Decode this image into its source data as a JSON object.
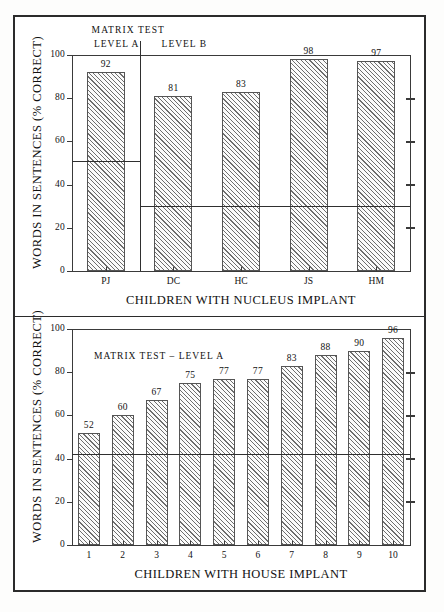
{
  "figure": {
    "background_color": "#ffffff",
    "frame_color": "#2b2b2b"
  },
  "chart_data": [
    {
      "type": "bar",
      "panel": "top",
      "title": "MATRIX TEST",
      "xlabel": "CHILDREN WITH NUCLEUS IMPLANT",
      "ylabel": "WORDS IN SENTENCES (% CORRECT)",
      "ylim": [
        0,
        100
      ],
      "yticks": [
        0,
        20,
        40,
        60,
        80,
        100
      ],
      "ytick_labels": [
        "0",
        "20",
        "40",
        "60",
        "80",
        "100"
      ],
      "grid": false,
      "legend": "none",
      "categories": [
        "PJ",
        "DC",
        "HC",
        "JS",
        "HM"
      ],
      "values": [
        92,
        81,
        83,
        98,
        97
      ],
      "value_labels": [
        "92",
        "81",
        "83",
        "98",
        "97"
      ],
      "groups": [
        {
          "label": "LEVEL A",
          "categories": [
            "PJ"
          ],
          "reference_line": 51
        },
        {
          "label": "LEVEL B",
          "categories": [
            "DC",
            "HC",
            "JS",
            "HM"
          ],
          "reference_line": 30
        }
      ],
      "group_divider_after": "PJ"
    },
    {
      "type": "bar",
      "panel": "bottom",
      "title": "MATRIX TEST – LEVEL A",
      "xlabel": "CHILDREN WITH HOUSE IMPLANT",
      "ylabel": "WORDS IN SENTENCES (% CORRECT)",
      "ylim": [
        0,
        100
      ],
      "yticks": [
        0,
        20,
        40,
        60,
        80,
        100
      ],
      "ytick_labels": [
        "0",
        "20",
        "40",
        "60",
        "80",
        "100"
      ],
      "grid": false,
      "legend": "none",
      "categories": [
        "1",
        "2",
        "3",
        "4",
        "5",
        "6",
        "7",
        "8",
        "9",
        "10"
      ],
      "values": [
        52,
        60,
        67,
        75,
        77,
        77,
        83,
        88,
        90,
        96
      ],
      "value_labels": [
        "52",
        "60",
        "67",
        "75",
        "77",
        "77",
        "83",
        "88",
        "90",
        "96"
      ],
      "reference_line": 42
    }
  ],
  "top_chart": {
    "title": "MATRIX TEST",
    "level_a_label": "LEVEL A",
    "level_b_label": "LEVEL B",
    "yaxis_title": "WORDS IN SENTENCES (% CORRECT)",
    "xaxis_title": "CHILDREN WITH NUCLEUS IMPLANT",
    "ytick_labels": [
      "100",
      "80",
      "60",
      "40",
      "20",
      "0"
    ],
    "bars": [
      {
        "category": "PJ",
        "value": 92,
        "label": "92"
      },
      {
        "category": "DC",
        "value": 81,
        "label": "81"
      },
      {
        "category": "HC",
        "value": 83,
        "label": "83"
      },
      {
        "category": "JS",
        "value": 98,
        "label": "98"
      },
      {
        "category": "HM",
        "value": 97,
        "label": "97"
      }
    ]
  },
  "bottom_chart": {
    "title": "MATRIX TEST – LEVEL A",
    "yaxis_title": "WORDS IN SENTENCES (% CORRECT)",
    "xaxis_title": "CHILDREN WITH HOUSE IMPLANT",
    "ytick_labels": [
      "100",
      "80",
      "60",
      "40",
      "20",
      "0"
    ],
    "bars": [
      {
        "category": "1",
        "value": 52,
        "label": "52"
      },
      {
        "category": "2",
        "value": 60,
        "label": "60"
      },
      {
        "category": "3",
        "value": 67,
        "label": "67"
      },
      {
        "category": "4",
        "value": 75,
        "label": "75"
      },
      {
        "category": "5",
        "value": 77,
        "label": "77"
      },
      {
        "category": "6",
        "value": 77,
        "label": "77"
      },
      {
        "category": "7",
        "value": 83,
        "label": "83"
      },
      {
        "category": "8",
        "value": 88,
        "label": "88"
      },
      {
        "category": "9",
        "value": 90,
        "label": "90"
      },
      {
        "category": "10",
        "value": 96,
        "label": "96"
      }
    ]
  }
}
